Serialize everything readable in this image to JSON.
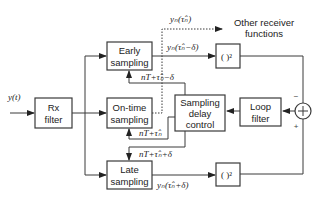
{
  "diagram": {
    "input_label": "y(t)",
    "blocks": {
      "rx_filter": [
        "Rx",
        "filter"
      ],
      "early": [
        "Early",
        "sampling"
      ],
      "ontime": [
        "On-time",
        "sampling"
      ],
      "late": [
        "Late",
        "sampling"
      ],
      "delay_ctrl": [
        "Sampling",
        "delay",
        "control"
      ],
      "loop_filter": [
        "Loop",
        "filter"
      ],
      "square_top": "( )²",
      "square_bottom": "( )²",
      "summer": "+"
    },
    "signals": {
      "ontime_out": "yₙ(τ̂ₙ)",
      "early_out": "yₙ(τ̂ₙ−δ)",
      "late_out": "yₙ(τ̂ₙ+δ)",
      "early_time": "nT+τ̂ₙ−δ",
      "ontime_time": "nT+τ̂ₙ",
      "late_time": "nT+τ̂ₙ+δ"
    },
    "other_output": [
      "Other receiver",
      "functions"
    ],
    "summer_signs": {
      "top": "−",
      "bottom": "+"
    }
  }
}
